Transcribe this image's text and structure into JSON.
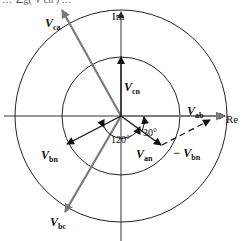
{
  "diagram": {
    "type": "phasor-diagram",
    "cropped_header_text": "… ∠g( V cn ) …",
    "axes": {
      "imag_label": "Im",
      "real_label": "Re"
    },
    "center": {
      "x": 121,
      "y": 116
    },
    "circles": [
      {
        "name": "inner-circle",
        "radius": 59
      },
      {
        "name": "outer-circle",
        "radius": 106
      }
    ],
    "phasors": [
      {
        "name": "V_an",
        "base": "V",
        "sub": "an",
        "angle_deg": -30,
        "magnitude": "phase",
        "style": "solid-black"
      },
      {
        "name": "V_bn",
        "base": "V",
        "sub": "bn",
        "angle_deg": -150,
        "magnitude": "phase",
        "style": "solid-black"
      },
      {
        "name": "V_cn",
        "base": "V",
        "sub": "cn",
        "angle_deg": 90,
        "magnitude": "phase",
        "style": "solid-black"
      },
      {
        "name": "V_ab",
        "base": "V",
        "sub": "ab",
        "angle_deg": 0,
        "magnitude": "line",
        "style": "solid-gray"
      },
      {
        "name": "V_bc",
        "base": "V",
        "sub": "bc",
        "angle_deg": -120,
        "magnitude": "line",
        "style": "solid-gray"
      },
      {
        "name": "V_ca",
        "base": "V",
        "sub": "ca",
        "angle_deg": 120,
        "magnitude": "line",
        "style": "solid-gray"
      },
      {
        "name": "-V_bn",
        "base": "− V",
        "sub": "bn",
        "angle_deg": 30,
        "magnitude": "phase",
        "style": "dashed-black",
        "origin": "tip of V_an"
      }
    ],
    "angle_labels": [
      {
        "text": "120°"
      },
      {
        "text": "30°"
      }
    ],
    "colors": {
      "line_phasor": "#7a7a7a",
      "phase_phasor": "#111111",
      "axis": "#333333",
      "circle": "#222222"
    }
  }
}
